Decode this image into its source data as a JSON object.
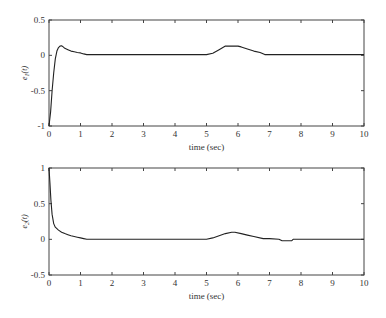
{
  "chart_data": [
    {
      "type": "line",
      "title": "",
      "xlabel": "time (sec)",
      "ylabel": "e1(t)",
      "xlim": [
        0,
        10
      ],
      "ylim": [
        -1,
        0.5
      ],
      "xticks": [
        0,
        1,
        2,
        3,
        4,
        5,
        6,
        7,
        8,
        9,
        10
      ],
      "yticks": [
        -1,
        -0.5,
        0,
        0.5
      ],
      "ytick_labels": [
        "-1",
        "-0.5",
        "0",
        "0.5"
      ],
      "grid": false,
      "series": [
        {
          "name": "e1(t)",
          "x": [
            0,
            0.05,
            0.1,
            0.15,
            0.2,
            0.25,
            0.3,
            0.35,
            0.4,
            0.45,
            0.5,
            0.6,
            0.7,
            0.8,
            0.9,
            1.0,
            1.1,
            1.2,
            2,
            3,
            4,
            5.0,
            5.2,
            5.4,
            5.6,
            5.8,
            6.0,
            6.1,
            6.3,
            6.5,
            6.7,
            6.85,
            7,
            8,
            9,
            10
          ],
          "values": [
            -1.0,
            -0.8,
            -0.5,
            -0.25,
            -0.05,
            0.06,
            0.11,
            0.13,
            0.135,
            0.12,
            0.1,
            0.08,
            0.06,
            0.05,
            0.04,
            0.035,
            0.02,
            0.01,
            0.01,
            0.01,
            0.01,
            0.01,
            0.03,
            0.08,
            0.13,
            0.13,
            0.13,
            0.12,
            0.09,
            0.06,
            0.04,
            0.01,
            0.01,
            0.01,
            0.01,
            0.01
          ]
        }
      ]
    },
    {
      "type": "line",
      "title": "",
      "xlabel": "time (sec)",
      "ylabel": "e2(t)",
      "xlim": [
        0,
        10
      ],
      "ylim": [
        -0.5,
        1
      ],
      "xticks": [
        0,
        1,
        2,
        3,
        4,
        5,
        6,
        7,
        8,
        9,
        10
      ],
      "yticks": [
        -0.5,
        0,
        0.5,
        1
      ],
      "ytick_labels": [
        "-0.5",
        "0",
        "0.5",
        "1"
      ],
      "grid": false,
      "series": [
        {
          "name": "e2(t)",
          "x": [
            0,
            0.03,
            0.06,
            0.1,
            0.15,
            0.2,
            0.3,
            0.4,
            0.5,
            0.6,
            0.7,
            0.8,
            0.9,
            1.0,
            1.1,
            1.2,
            2,
            3,
            4,
            5.0,
            5.2,
            5.4,
            5.6,
            5.8,
            5.9,
            6.1,
            6.3,
            6.5,
            6.8,
            7.0,
            7.3,
            7.4,
            7.7,
            7.75,
            8,
            9,
            10
          ],
          "values": [
            1.0,
            0.8,
            0.55,
            0.35,
            0.22,
            0.17,
            0.13,
            0.1,
            0.08,
            0.065,
            0.05,
            0.04,
            0.03,
            0.02,
            0.01,
            0.0,
            0.0,
            0.0,
            0.0,
            0.0,
            0.02,
            0.05,
            0.08,
            0.1,
            0.1,
            0.08,
            0.06,
            0.04,
            0.01,
            0.01,
            0.0,
            -0.02,
            -0.02,
            0.0,
            0.0,
            0.0,
            0.0
          ]
        }
      ]
    }
  ],
  "plots": [
    {
      "ylabel_main": "e",
      "ylabel_sub": "1",
      "ylabel_arg": "(t)",
      "xlabel": "time (sec)"
    },
    {
      "ylabel_main": "e",
      "ylabel_sub": "2",
      "ylabel_arg": "(t)",
      "xlabel": "time (sec)"
    }
  ]
}
